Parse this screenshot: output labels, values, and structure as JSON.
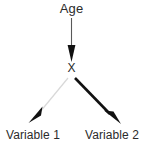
{
  "figure": {
    "type": "path-diagram",
    "background_color": "#ffffff",
    "nodes": [
      {
        "id": "age",
        "label": "Age",
        "x": 71,
        "y": 10
      },
      {
        "id": "x",
        "label": "X",
        "x": 71,
        "y": 69
      },
      {
        "id": "variable_1",
        "label": "Variable 1",
        "x": 33,
        "y": 135
      },
      {
        "id": "variable_2",
        "label": "Variable 2",
        "x": 112,
        "y": 135
      }
    ],
    "edges": [
      {
        "id": "age-to-x",
        "from": "age",
        "to": "x",
        "style": "thin",
        "color": "#595959",
        "stroke_width": 1,
        "arrowhead": "filled-narrow-triangle",
        "arrowhead_color": "#111111"
      },
      {
        "id": "x-to-variable-1",
        "from": "x",
        "to": "variable_1",
        "style": "faint",
        "color": "#d8d8d8",
        "stroke_width": 1,
        "arrowhead": "filled-narrow-triangle",
        "arrowhead_color": "#111111"
      },
      {
        "id": "x-to-variable-2",
        "from": "x",
        "to": "variable_2",
        "style": "bold",
        "color": "#111111",
        "stroke_width": 3,
        "arrowhead": "filled-narrow-triangle",
        "arrowhead_color": "#111111"
      }
    ]
  }
}
